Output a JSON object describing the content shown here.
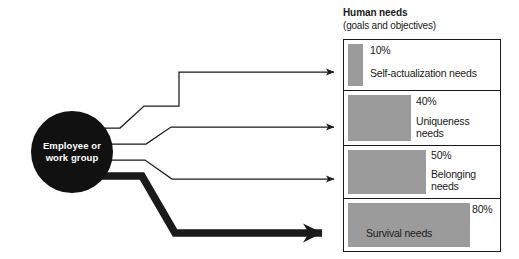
{
  "diagram": {
    "source": {
      "label": "Employee or\nwork group"
    },
    "header": {
      "title": "Human needs",
      "subtitle": "(goals and objectives)"
    },
    "needs": [
      {
        "percent": "10%",
        "name": "Self-actualization needs",
        "value": 10
      },
      {
        "percent": "40%",
        "name": "Uniqueness\nneeds",
        "value": 40
      },
      {
        "percent": "50%",
        "name": "Belonging\nneeds",
        "value": 50
      },
      {
        "percent": "80%",
        "name": "Survival needs",
        "value": 80
      }
    ],
    "colors": {
      "bar_fill": "#9b9b9b",
      "node_fill": "#111111",
      "node_text": "#ffffff",
      "stroke": "#1a1a1a",
      "background": "#ffffff"
    }
  }
}
